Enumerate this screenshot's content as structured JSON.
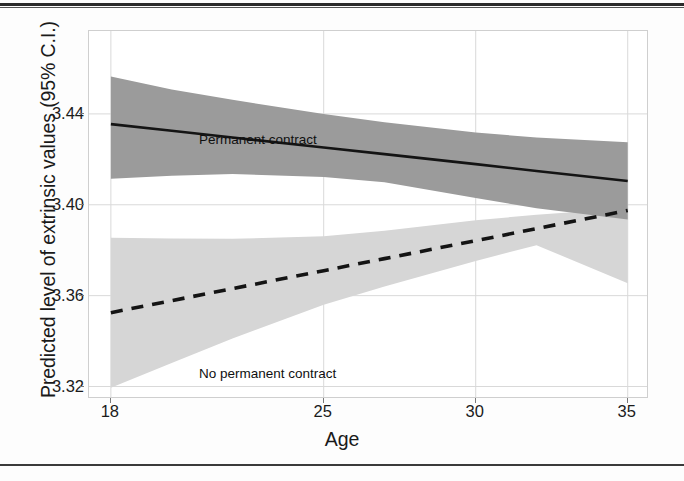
{
  "figure": {
    "background_color": "#fdfdfd",
    "panel_border_color": "#cfcfcf",
    "grid_color": "#d9d9d9"
  },
  "axes": {
    "y_title": "Predicted level of extrinsic values (95% C.I.)",
    "x_title": "Age",
    "y_ticks": [
      "3.44",
      "3.40",
      "3.36",
      "3.32"
    ],
    "x_ticks": [
      "18",
      "25",
      "30",
      "35"
    ]
  },
  "annotations": {
    "permanent": "Permanent contract",
    "no_permanent": "No permanent contract"
  },
  "chart_data": {
    "type": "line",
    "title": "",
    "subtitle": "",
    "xlabel": "Age",
    "ylabel": "Predicted level of extrinsic values (95% C.I.)",
    "xlim": [
      17.28,
      35.7
    ],
    "ylim": [
      3.3145,
      3.4765
    ],
    "x_ticks": [
      18,
      25,
      30,
      35
    ],
    "y_ticks": [
      3.32,
      3.36,
      3.4,
      3.44
    ],
    "grid": true,
    "legend_position": "inline-annotation",
    "x": [
      18,
      20,
      22,
      25,
      27,
      30,
      32,
      35
    ],
    "series": [
      {
        "name": "Permanent contract",
        "line_style": "solid",
        "color": "#141414",
        "band_color": "#9b9b9b",
        "band_opacity": 1.0,
        "values": [
          3.4355,
          3.4326,
          3.4296,
          3.4252,
          3.4223,
          3.4179,
          3.4149,
          3.4105
        ],
        "ci_upper": [
          3.4565,
          3.4508,
          3.4462,
          3.44,
          3.4363,
          3.4318,
          3.4296,
          3.4275
        ],
        "ci_lower": [
          3.4115,
          3.4128,
          3.4135,
          3.4122,
          3.4099,
          3.403,
          3.3985,
          3.3935
        ]
      },
      {
        "name": "No permanent contract",
        "line_style": "dashed",
        "color": "#141414",
        "band_color": "#d6d6d6",
        "band_opacity": 1.0,
        "values": [
          3.3525,
          3.3578,
          3.3631,
          3.371,
          3.3763,
          3.3842,
          3.3895,
          3.3975
        ],
        "ci_upper": [
          3.3855,
          3.3852,
          3.385,
          3.3862,
          3.3886,
          3.3932,
          3.3956,
          3.3985
        ],
        "ci_lower": [
          3.3195,
          3.3303,
          3.3411,
          3.356,
          3.364,
          3.3753,
          3.3822,
          3.3655
        ]
      }
    ],
    "annotations": [
      {
        "text": "Permanent contract",
        "x": 18.7,
        "y": 3.4405
      },
      {
        "text": "No permanent contract",
        "x": 18.7,
        "y": 3.3355
      }
    ]
  }
}
